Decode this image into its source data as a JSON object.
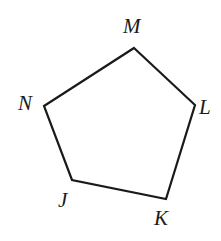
{
  "figure": {
    "type": "polygon-diagram",
    "shape_name": "pentagon",
    "background_color": "#ffffff",
    "stroke_color": "#1a1a1a",
    "stroke_width": 2.2,
    "fill": "none",
    "canvas": {
      "width": 221,
      "height": 241
    },
    "vertices": [
      {
        "id": "M",
        "label": "M",
        "x": 134,
        "y": 48,
        "label_x": 123,
        "label_y": 16,
        "label_position": "above"
      },
      {
        "id": "L",
        "label": "L",
        "x": 195,
        "y": 105,
        "label_x": 199,
        "label_y": 97,
        "label_position": "right"
      },
      {
        "id": "K",
        "label": "K",
        "x": 166,
        "y": 199,
        "label_x": 154,
        "label_y": 208,
        "label_position": "below"
      },
      {
        "id": "J",
        "label": "J",
        "x": 72,
        "y": 180,
        "label_x": 58,
        "label_y": 190,
        "label_position": "below-left"
      },
      {
        "id": "N",
        "label": "N",
        "x": 44,
        "y": 106,
        "label_x": 18,
        "label_y": 93,
        "label_position": "left"
      }
    ],
    "edges": [
      {
        "id": "MN",
        "from": "M",
        "to": "N"
      },
      {
        "id": "ML",
        "from": "M",
        "to": "L"
      },
      {
        "id": "LK",
        "from": "L",
        "to": "K"
      },
      {
        "id": "KJ",
        "from": "K",
        "to": "J"
      },
      {
        "id": "JN",
        "from": "J",
        "to": "N"
      }
    ],
    "path_d": "M 134 48 L 195 105 L 166 199 L 72 180 L 44 106 Z"
  }
}
